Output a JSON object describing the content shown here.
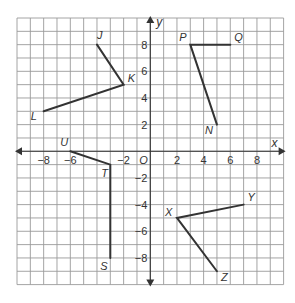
{
  "diagram": {
    "type": "coordinate-plane",
    "x_range": [
      -10,
      10
    ],
    "y_range": [
      -10,
      10
    ],
    "grid_step": 1,
    "axis_labels": {
      "x": "x",
      "y": "y",
      "origin": "O"
    },
    "x_tick_labels": [
      {
        "value": -8,
        "text": "−8"
      },
      {
        "value": -6,
        "text": "−6"
      },
      {
        "value": -2,
        "text": "−2"
      },
      {
        "value": 2,
        "text": "2"
      },
      {
        "value": 4,
        "text": "4"
      },
      {
        "value": 6,
        "text": "6"
      },
      {
        "value": 8,
        "text": "8"
      }
    ],
    "y_tick_labels": [
      {
        "value": 8,
        "text": "8"
      },
      {
        "value": 6,
        "text": "6"
      },
      {
        "value": 4,
        "text": "4"
      },
      {
        "value": 2,
        "text": "2"
      },
      {
        "value": -2,
        "text": "−2"
      },
      {
        "value": -4,
        "text": "−4"
      },
      {
        "value": -6,
        "text": "−6"
      },
      {
        "value": -8,
        "text": "−8"
      }
    ],
    "points": [
      {
        "name": "J",
        "x": -4,
        "y": 8,
        "label_dx": 0,
        "label_dy": -6
      },
      {
        "name": "K",
        "x": -2,
        "y": 5,
        "label_dx": 4,
        "label_dy": -3
      },
      {
        "name": "L",
        "x": -8,
        "y": 3,
        "label_dx": -13,
        "label_dy": 9
      },
      {
        "name": "P",
        "x": 3,
        "y": 8,
        "label_dx": -11,
        "label_dy": -4
      },
      {
        "name": "Q",
        "x": 6,
        "y": 8,
        "label_dx": 4,
        "label_dy": -4
      },
      {
        "name": "N",
        "x": 5,
        "y": 2,
        "label_dx": -12,
        "label_dy": 9
      },
      {
        "name": "U",
        "x": -6,
        "y": 0,
        "label_dx": -10,
        "label_dy": -5
      },
      {
        "name": "T",
        "x": -3,
        "y": -1,
        "label_dx": -9,
        "label_dy": 12
      },
      {
        "name": "S",
        "x": -3,
        "y": -8,
        "label_dx": -10,
        "label_dy": 12
      },
      {
        "name": "X",
        "x": 2,
        "y": -5,
        "label_dx": -12,
        "label_dy": -2
      },
      {
        "name": "Y",
        "x": 7,
        "y": -4,
        "label_dx": 4,
        "label_dy": -4
      },
      {
        "name": "Z",
        "x": 5,
        "y": -9,
        "label_dx": 4,
        "label_dy": 10
      }
    ],
    "angles": [
      {
        "name": "angle-JKL",
        "path": [
          "J",
          "K",
          "L"
        ]
      },
      {
        "name": "angle-QPN",
        "path": [
          "Q",
          "P",
          "N"
        ]
      },
      {
        "name": "angle-UTS",
        "path": [
          "U",
          "T",
          "S"
        ]
      },
      {
        "name": "angle-YXZ",
        "path": [
          "Y",
          "X",
          "Z"
        ]
      }
    ]
  }
}
